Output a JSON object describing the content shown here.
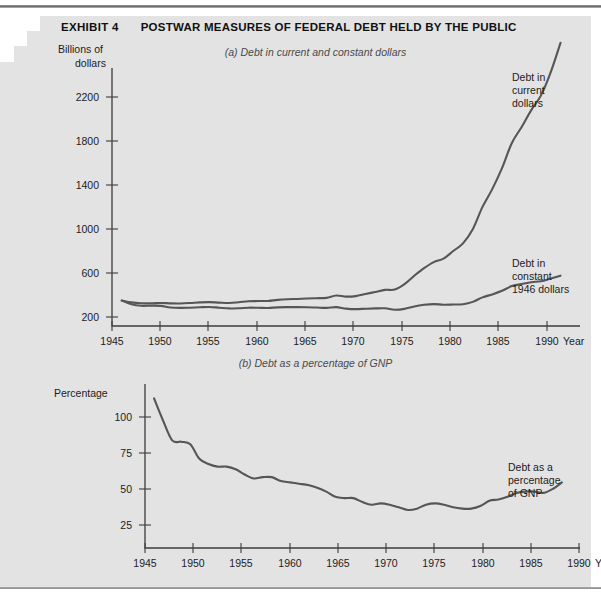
{
  "header": {
    "exhibit_number": "EXHIBIT 4",
    "title": "POSTWAR MEASURES OF FEDERAL DEBT HELD BY THE PUBLIC"
  },
  "panel_a": {
    "caption": "(a)  Debt in current and constant dollars",
    "y_axis_title_line1": "Billions of",
    "y_axis_title_line2": "dollars",
    "x_axis_title": "Year",
    "annotation_current": [
      "Debt in",
      "current",
      "dollars"
    ],
    "annotation_constant": [
      "Debt in",
      "constant",
      "1946 dollars"
    ]
  },
  "panel_b": {
    "caption": "(b)  Debt as a percentage of GNP",
    "y_axis_title": "Percentage",
    "x_axis_title": "Year",
    "annotation": [
      "Debt as a",
      "percentage",
      "of GNP"
    ]
  },
  "colors": {
    "background": "#e3e3e3",
    "paper": "#ffffff",
    "line": "#565656",
    "axis": "#3c3c3c",
    "text": "#1c1c1c",
    "caption": "#4a4a4a"
  },
  "chart_data": [
    {
      "type": "line",
      "id": "panel-a",
      "title": "(a)  Debt in current and constant dollars",
      "xlabel": "Year",
      "ylabel": "Billions of dollars",
      "xlim": [
        1945,
        1993
      ],
      "ylim": [
        0,
        2450
      ],
      "xticks": [
        1945,
        1950,
        1955,
        1960,
        1965,
        1970,
        1975,
        1980,
        1985,
        1990
      ],
      "yticks": [
        200,
        600,
        1000,
        1400,
        1800,
        2200
      ],
      "grid": false,
      "legend": "inline-annotations",
      "x": [
        1946,
        1947,
        1948,
        1949,
        1950,
        1951,
        1952,
        1953,
        1954,
        1955,
        1956,
        1957,
        1958,
        1959,
        1960,
        1961,
        1962,
        1963,
        1964,
        1965,
        1966,
        1967,
        1968,
        1969,
        1970,
        1971,
        1972,
        1973,
        1974,
        1975,
        1976,
        1977,
        1978,
        1979,
        1980,
        1981,
        1982,
        1983,
        1984,
        1985,
        1986,
        1987,
        1988,
        1989,
        1990,
        1991
      ],
      "series": [
        {
          "name": "Debt in current dollars",
          "values": [
            242,
            224,
            216,
            215,
            219,
            215,
            214,
            218,
            224,
            227,
            222,
            219,
            226,
            235,
            237,
            238,
            248,
            254,
            257,
            261,
            264,
            267,
            290,
            279,
            284,
            304,
            323,
            343,
            346,
            397,
            477,
            549,
            607,
            640,
            712,
            785,
            919,
            1131,
            1300,
            1499,
            1736,
            1888,
            2050,
            2190,
            2411,
            2689
          ]
        },
        {
          "name": "Debt in constant 1946 dollars",
          "values": [
            242,
            206,
            192,
            193,
            191,
            176,
            172,
            174,
            178,
            181,
            174,
            167,
            169,
            174,
            173,
            171,
            177,
            179,
            179,
            178,
            175,
            172,
            179,
            165,
            160,
            164,
            167,
            168,
            155,
            163,
            186,
            201,
            208,
            202,
            204,
            207,
            229,
            272,
            300,
            334,
            379,
            398,
            416,
            425,
            451,
            478
          ]
        }
      ]
    },
    {
      "type": "line",
      "id": "panel-b",
      "title": "(b)  Debt as a percentage of GNP",
      "xlabel": "Year",
      "ylabel": "Percentage",
      "xlim": [
        1945,
        1993
      ],
      "ylim": [
        0,
        125
      ],
      "xticks": [
        1945,
        1950,
        1955,
        1960,
        1965,
        1970,
        1975,
        1980,
        1985,
        1990
      ],
      "yticks": [
        25,
        50,
        75,
        100
      ],
      "grid": false,
      "legend": "inline-annotations",
      "x": [
        1946,
        1947,
        1948,
        1949,
        1950,
        1951,
        1952,
        1953,
        1954,
        1955,
        1956,
        1957,
        1958,
        1959,
        1960,
        1961,
        1962,
        1963,
        1964,
        1965,
        1966,
        1967,
        1968,
        1969,
        1970,
        1971,
        1972,
        1973,
        1974,
        1975,
        1976,
        1977,
        1978,
        1979,
        1980,
        1981,
        1982,
        1983,
        1984,
        1985,
        1986,
        1987,
        1988,
        1989,
        1990,
        1991
      ],
      "series": [
        {
          "name": "Debt as a percentage of GNP",
          "values": [
            114,
            97,
            82,
            81,
            79,
            68,
            64,
            62,
            62,
            60,
            56,
            53,
            54,
            54,
            51,
            50,
            49,
            48,
            46,
            43,
            39,
            38,
            38,
            35,
            33,
            34,
            33,
            31,
            29,
            30,
            33,
            34,
            33,
            31,
            30,
            30,
            32,
            36,
            37,
            39,
            42,
            43,
            43,
            42,
            45,
            50
          ]
        }
      ]
    }
  ]
}
